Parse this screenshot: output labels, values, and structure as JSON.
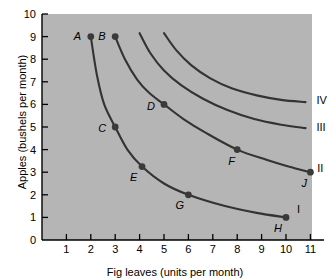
{
  "chart_data": {
    "type": "line",
    "title": "",
    "xlabel": "Fig leaves (units per month)",
    "ylabel": "Apples (bushels per month)",
    "xlim": [
      0,
      11.8
    ],
    "ylim": [
      0,
      10
    ],
    "xticks": [
      1,
      2,
      3,
      4,
      5,
      6,
      7,
      8,
      9,
      10,
      11
    ],
    "yticks": [
      0,
      1,
      2,
      3,
      4,
      5,
      6,
      7,
      8,
      9,
      10
    ],
    "grid": false,
    "legend_position": "inline-right-of-curve",
    "background_color": "#b5b5b5",
    "curve_color": "#333333",
    "point_color": "#3a3a3a",
    "series": [
      {
        "name": "I",
        "label": "I",
        "label_x": 10.45,
        "label_y": 1.35,
        "points": [
          {
            "label": "A",
            "x": 2,
            "y": 9
          },
          {
            "label": "C",
            "x": 3,
            "y": 5
          },
          {
            "label": "E",
            "x": 4.1,
            "y": 3.25
          },
          {
            "label": "G",
            "x": 6,
            "y": 2
          },
          {
            "label": "H",
            "x": 10,
            "y": 1
          }
        ],
        "path": [
          {
            "x": 2,
            "y": 9
          },
          {
            "x": 2.25,
            "y": 7.3
          },
          {
            "x": 2.55,
            "y": 6.0
          },
          {
            "x": 3,
            "y": 5
          },
          {
            "x": 3.5,
            "y": 4.0
          },
          {
            "x": 4.1,
            "y": 3.25
          },
          {
            "x": 5,
            "y": 2.5
          },
          {
            "x": 6,
            "y": 2.0
          },
          {
            "x": 7.5,
            "y": 1.5
          },
          {
            "x": 8.8,
            "y": 1.2
          },
          {
            "x": 10,
            "y": 1
          }
        ]
      },
      {
        "name": "II",
        "label": "II",
        "label_x": 11.28,
        "label_y": 3.15,
        "points": [
          {
            "label": "B",
            "x": 3,
            "y": 9
          },
          {
            "label": "D",
            "x": 5,
            "y": 6
          },
          {
            "label": "F",
            "x": 8,
            "y": 4
          },
          {
            "label": "J",
            "x": 11,
            "y": 3
          }
        ],
        "path": [
          {
            "x": 3,
            "y": 9
          },
          {
            "x": 3.4,
            "y": 8.0
          },
          {
            "x": 3.9,
            "y": 7.1
          },
          {
            "x": 4.4,
            "y": 6.5
          },
          {
            "x": 5,
            "y": 6
          },
          {
            "x": 5.8,
            "y": 5.35
          },
          {
            "x": 6.7,
            "y": 4.75
          },
          {
            "x": 8,
            "y": 4
          },
          {
            "x": 9.2,
            "y": 3.55
          },
          {
            "x": 10.1,
            "y": 3.25
          },
          {
            "x": 11,
            "y": 3
          }
        ]
      },
      {
        "name": "III",
        "label": "III",
        "label_x": 11.25,
        "label_y": 4.95,
        "points": [],
        "path": [
          {
            "x": 4.0,
            "y": 9.15
          },
          {
            "x": 4.45,
            "y": 8.25
          },
          {
            "x": 5.0,
            "y": 7.5
          },
          {
            "x": 5.7,
            "y": 6.85
          },
          {
            "x": 6.6,
            "y": 6.25
          },
          {
            "x": 7.6,
            "y": 5.75
          },
          {
            "x": 8.7,
            "y": 5.35
          },
          {
            "x": 9.8,
            "y": 5.1
          },
          {
            "x": 10.8,
            "y": 4.95
          }
        ]
      },
      {
        "name": "IV",
        "label": "IV",
        "label_x": 11.25,
        "label_y": 6.15,
        "points": [],
        "path": [
          {
            "x": 5.0,
            "y": 9.15
          },
          {
            "x": 5.5,
            "y": 8.4
          },
          {
            "x": 6.1,
            "y": 7.75
          },
          {
            "x": 6.9,
            "y": 7.15
          },
          {
            "x": 7.8,
            "y": 6.7
          },
          {
            "x": 8.8,
            "y": 6.4
          },
          {
            "x": 9.8,
            "y": 6.2
          },
          {
            "x": 10.8,
            "y": 6.1
          }
        ]
      }
    ],
    "point_labels": [
      {
        "text": "A",
        "x": 2,
        "y": 9,
        "dx": -13,
        "dy": 0
      },
      {
        "text": "B",
        "x": 3,
        "y": 9,
        "dx": -13,
        "dy": 0
      },
      {
        "text": "C",
        "x": 3,
        "y": 5,
        "dx": -13,
        "dy": 2
      },
      {
        "text": "D",
        "x": 5,
        "y": 6,
        "dx": -13,
        "dy": 3
      },
      {
        "text": "E",
        "x": 4.1,
        "y": 3.25,
        "dx": -8,
        "dy": 11
      },
      {
        "text": "F",
        "x": 8,
        "y": 4,
        "dx": -5,
        "dy": 12
      },
      {
        "text": "G",
        "x": 6,
        "y": 2,
        "dx": -9,
        "dy": 11
      },
      {
        "text": "H",
        "x": 10,
        "y": 1,
        "dx": -8,
        "dy": 12
      },
      {
        "text": "J",
        "x": 11,
        "y": 3,
        "dx": -5,
        "dy": 12
      }
    ]
  }
}
